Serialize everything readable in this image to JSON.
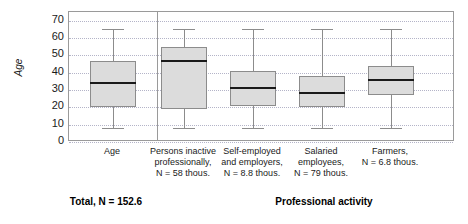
{
  "chart_data": {
    "type": "box",
    "title": "",
    "ylabel": "Age",
    "xlabel": "Professional activity",
    "ylim": [
      0,
      75
    ],
    "yticks": [
      0,
      10,
      20,
      30,
      40,
      50,
      60,
      70
    ],
    "grid": true,
    "legend": "none",
    "categories": [
      "Age",
      "Persons inactive professionally, N = 58 thous.",
      "Self-employed and employers, N = 8.8 thous.",
      "Salaried employees, N = 79 thous.",
      "Farmers, N = 6.8 thous."
    ],
    "boxes": [
      {
        "name": "Age",
        "whisker_low": 8,
        "q1": 20,
        "median": 34,
        "q3": 47,
        "whisker_high": 65
      },
      {
        "name": "Persons inactive",
        "whisker_low": 8,
        "q1": 19,
        "median": 47,
        "q3": 55,
        "whisker_high": 65
      },
      {
        "name": "Self-employed",
        "whisker_low": 8,
        "q1": 21,
        "median": 31,
        "q3": 41,
        "whisker_high": 65
      },
      {
        "name": "Salaried employees",
        "whisker_low": 8,
        "q1": 20,
        "median": 28,
        "q3": 38,
        "whisker_high": 65
      },
      {
        "name": "Farmers",
        "whisker_low": 8,
        "q1": 27,
        "median": 36,
        "q3": 44,
        "whisker_high": 65
      }
    ],
    "colors": {
      "box_fill": "#dcdcdc",
      "box_border": "#8c8c8c",
      "median": "#1a1a1a",
      "grid": "#b4b4c8",
      "axis": "#9a9a9a"
    }
  },
  "axis": {
    "y_title": "Age",
    "ticks": [
      "70",
      "60",
      "50",
      "40",
      "30",
      "20",
      "10",
      "0"
    ]
  },
  "x_labels": [
    {
      "lines": [
        "Age"
      ]
    },
    {
      "lines": [
        "Persons inactive",
        "professionally,",
        "N = 58 thous."
      ]
    },
    {
      "lines": [
        "Self-employed",
        "and employers,",
        "N = 8.8 thous."
      ]
    },
    {
      "lines": [
        "Salaried",
        "employees,",
        "N = 79 thous."
      ]
    },
    {
      "lines": [
        "Farmers,",
        "N = 6.8 thous."
      ]
    }
  ],
  "footer": {
    "total": "Total, N = 152.6",
    "group": "Professional activity"
  }
}
